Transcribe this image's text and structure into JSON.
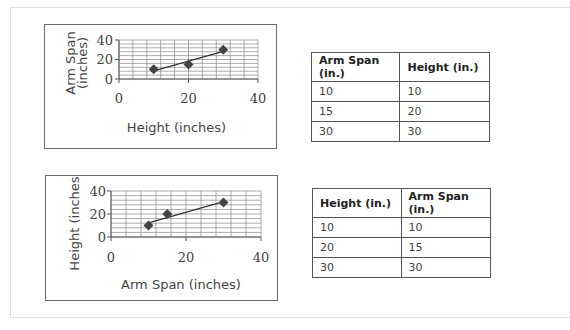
{
  "chart_data": [
    {
      "type": "scatter",
      "title": "",
      "xlabel": "Height (inches)",
      "ylabel": "Arm Span\n(inches)",
      "ylabel_lines": [
        "Arm Span",
        "(inches)"
      ],
      "xlim": [
        0,
        40
      ],
      "ylim": [
        0,
        40
      ],
      "xticks": [
        "0",
        "20",
        "40"
      ],
      "yticks": [
        "0",
        "20",
        "40"
      ],
      "grid": true,
      "trend_line": true,
      "marker": "diamond",
      "color": "#444444",
      "series": [
        {
          "name": "Arm Span vs Height",
          "x": [
            10,
            20,
            30
          ],
          "y": [
            10,
            15,
            30
          ]
        }
      ]
    },
    {
      "type": "scatter",
      "title": "",
      "xlabel": "Arm Span (inches)",
      "ylabel": "Height (inches)",
      "ylabel_lines": [
        "Height (inches)"
      ],
      "xlim": [
        0,
        40
      ],
      "ylim": [
        0,
        40
      ],
      "xticks": [
        "0",
        "20",
        "40"
      ],
      "yticks": [
        "0",
        "20",
        "40"
      ],
      "grid": true,
      "trend_line": true,
      "marker": "diamond",
      "color": "#444444",
      "series": [
        {
          "name": "Height vs Arm Span",
          "x": [
            10,
            15,
            30
          ],
          "y": [
            10,
            20,
            30
          ]
        }
      ]
    }
  ],
  "tables": [
    {
      "headers": [
        "Arm Span (in.)",
        "Height (in.)"
      ],
      "rows": [
        [
          "10",
          "10"
        ],
        [
          "15",
          "20"
        ],
        [
          "30",
          "30"
        ]
      ]
    },
    {
      "headers": [
        "Height (in.)",
        "Arm Span (in.)"
      ],
      "rows": [
        [
          "10",
          "10"
        ],
        [
          "20",
          "15"
        ],
        [
          "30",
          "30"
        ]
      ]
    }
  ]
}
